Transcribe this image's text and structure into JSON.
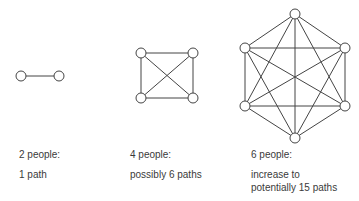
{
  "diagrams": [
    {
      "id": "two",
      "title": "2 people:",
      "caption": "1 path",
      "nodes": [
        [
          21,
          76
        ],
        [
          59,
          76
        ]
      ]
    },
    {
      "id": "four",
      "title": "4 people:",
      "caption": "possibly 6 paths",
      "nodes": [
        [
          141,
          53
        ],
        [
          193,
          53
        ],
        [
          141,
          98
        ],
        [
          193,
          98
        ]
      ]
    },
    {
      "id": "six",
      "title": "6 people:",
      "caption_line1": "increase to",
      "caption_line2": "potentially 15 paths",
      "nodes": [
        [
          295,
          14
        ],
        [
          245,
          48
        ],
        [
          345,
          48
        ],
        [
          245,
          106
        ],
        [
          345,
          106
        ],
        [
          295,
          138
        ]
      ]
    }
  ],
  "style": {
    "stroke": "#444444",
    "node_fill": "#ffffff",
    "node_radius": 5
  }
}
